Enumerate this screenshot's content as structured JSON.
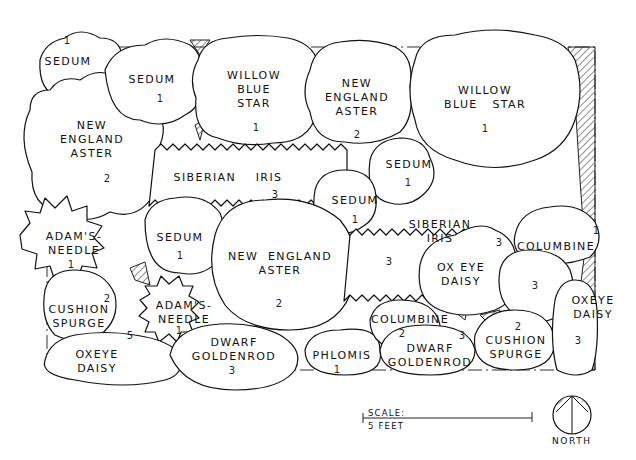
{
  "plan": {
    "groups": [
      {
        "id": "sedum-a",
        "name": "SEDUM",
        "count": "1"
      },
      {
        "id": "sedum-b",
        "name": "SEDUM",
        "count": "1"
      },
      {
        "id": "willow-blue-star-a",
        "name": "WILLOW\nBLUE\nSTAR",
        "count": "1"
      },
      {
        "id": "new-england-aster-a",
        "name": "NEW\nENGLAND\nASTER",
        "count": "2"
      },
      {
        "id": "willow-blue-star-b",
        "name": "WILLOW\nBLUE   STAR",
        "count": "1"
      },
      {
        "id": "new-england-aster-b",
        "name": "NEW\nENGLAND\nASTER",
        "count": "2"
      },
      {
        "id": "siberian-iris-a",
        "name": "SIBERIAN    IRIS",
        "count": "3"
      },
      {
        "id": "sedum-c",
        "name": "SEDUM",
        "count": "1"
      },
      {
        "id": "sedum-d",
        "name": "SEDUM",
        "count": "1"
      },
      {
        "id": "adams-needle-a",
        "name": "ADAM'S-\nNEEDLE",
        "count": "1"
      },
      {
        "id": "sedum-e",
        "name": "SEDUM",
        "count": "1"
      },
      {
        "id": "new-england-aster-c",
        "name": "NEW  ENGLAND\nASTER",
        "count": "2"
      },
      {
        "id": "siberian-iris-b",
        "name": "SIBERIAN\nIRIS",
        "count": "3"
      },
      {
        "id": "oxeye-daisy-a",
        "name": "OX EYE\nDAISY",
        "count": "3"
      },
      {
        "id": "columbine-a",
        "name": "COLUMBINE",
        "count": "1"
      },
      {
        "id": "columbine-b",
        "name": "",
        "count": "3"
      },
      {
        "id": "cushion-spurge-a",
        "name": "CUSHION\nSPURGE",
        "count": "2"
      },
      {
        "id": "adams-needle-b",
        "name": "ADAM'S-\nNEEDLE",
        "count": "1"
      },
      {
        "id": "oxeye-daisy-b",
        "name": "OXEYE\nDAISY",
        "count": "5"
      },
      {
        "id": "dwarf-goldenrod-a",
        "name": "DWARF\nGOLDENROD",
        "count": "3"
      },
      {
        "id": "phlomis",
        "name": "PHLOMIS",
        "count": "1"
      },
      {
        "id": "columbine-c",
        "name": "COLUMBINE",
        "count": "2"
      },
      {
        "id": "dwarf-goldenrod-b",
        "name": "DWARF\nGOLDENROD",
        "count": "3"
      },
      {
        "id": "cushion-spurge-b",
        "name": "CUSHION\nSPURGE",
        "count": "2"
      },
      {
        "id": "oxeye-daisy-c",
        "name": "OXEYE\nDAISY",
        "count": "3"
      }
    ]
  },
  "scale": {
    "label": "SCALE:",
    "value": "5 FEET"
  },
  "compass": {
    "label": "NORTH"
  },
  "colors": {
    "ink": "#111111",
    "paper": "#ffffff"
  }
}
